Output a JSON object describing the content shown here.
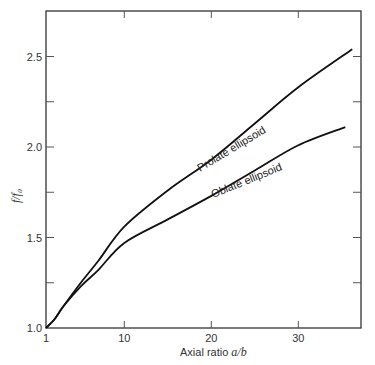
{
  "chart_data": {
    "type": "line",
    "title": "",
    "xlabel_prefix": "Axial ratio ",
    "xlabel_var": "a/b",
    "ylabel": "f/f₀",
    "xlim": [
      1,
      37.2
    ],
    "ylim": [
      1.0,
      2.75
    ],
    "xticks": [
      1,
      10,
      20,
      30
    ],
    "xtick_labels": [
      "1",
      "10",
      "20",
      "30"
    ],
    "yticks": [
      1.0,
      1.25,
      1.5,
      1.75,
      2.0,
      2.25,
      2.5
    ],
    "ytick_labels": [
      "1.0",
      "",
      "1.5",
      "",
      "2.0",
      "",
      "2.5"
    ],
    "grid": false,
    "series": [
      {
        "name": "Prolate ellipsoid",
        "x": [
          1,
          2,
          3,
          5,
          7,
          10,
          15,
          20,
          25,
          30,
          36.2
        ],
        "y": [
          1.0,
          1.05,
          1.12,
          1.25,
          1.37,
          1.56,
          1.76,
          1.93,
          2.13,
          2.33,
          2.54
        ]
      },
      {
        "name": "Oblate ellipsoid",
        "x": [
          1,
          2,
          3,
          5,
          7,
          10,
          15,
          20,
          25,
          30,
          35.4
        ],
        "y": [
          1.0,
          1.05,
          1.12,
          1.23,
          1.32,
          1.47,
          1.6,
          1.73,
          1.87,
          2.01,
          2.11
        ]
      }
    ],
    "annotations": [
      {
        "text": "Prolate ellipsoid",
        "series": "Prolate ellipsoid"
      },
      {
        "text": "Oblate ellipsoid",
        "series": "Oblate ellipsoid"
      }
    ]
  }
}
